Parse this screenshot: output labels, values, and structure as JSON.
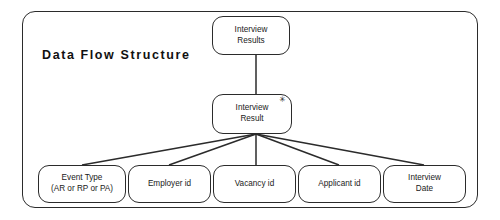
{
  "diagram": {
    "title": "Data  Flow  Structure",
    "type": "jackson-data-structure-diagram",
    "colors": {
      "background": "#ffffff",
      "stroke": "#2b2b2b",
      "text": "#1a1a1a"
    },
    "frame": {
      "x": 22,
      "y": 11,
      "width": 456,
      "height": 197
    },
    "iteration_marker": "✳",
    "nodes": {
      "root": {
        "label_line1": "Interview",
        "label_line2": "Results",
        "x": 212,
        "y": 16,
        "width": 78,
        "height": 39,
        "marker": ""
      },
      "record": {
        "label_line1": "Interview",
        "label_line2": "Result",
        "x": 212,
        "y": 94,
        "width": 80,
        "height": 40,
        "marker": "✳"
      }
    },
    "leaves": [
      {
        "label_line1": "Event Type",
        "label_line2": "(AR or RP or PA)",
        "x": 38,
        "y": 165,
        "width": 88,
        "height": 38
      },
      {
        "label_line1": "Employer id",
        "label_line2": "",
        "x": 128,
        "y": 165,
        "width": 83,
        "height": 38
      },
      {
        "label_line1": "Vacancy id",
        "label_line2": "",
        "x": 213,
        "y": 165,
        "width": 83,
        "height": 38
      },
      {
        "label_line1": "Applicant id",
        "label_line2": "",
        "x": 298,
        "y": 165,
        "width": 83,
        "height": 38
      },
      {
        "label_line1": "Interview",
        "label_line2": "Date",
        "x": 383,
        "y": 165,
        "width": 83,
        "height": 38
      }
    ],
    "connectors": {
      "junction_x": 256,
      "junction_y": 134,
      "root_stem": {
        "x": 256,
        "y_top": 55,
        "y_bottom": 94
      },
      "leaf_targets_x": [
        82,
        169,
        256,
        339,
        424
      ],
      "leaf_target_y": 165
    }
  }
}
